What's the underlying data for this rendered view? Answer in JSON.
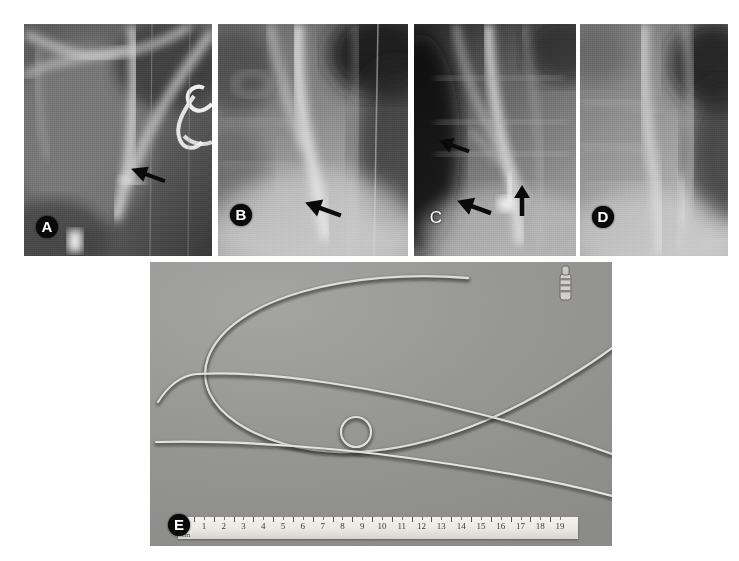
{
  "figure": {
    "caption_present": false,
    "background_color": "#ffffff",
    "width": 739,
    "height": 561,
    "panel_count": 5
  },
  "panels": [
    {
      "id": "A",
      "label": "A",
      "label_style": "circled-white-on-black",
      "type": "radiograph",
      "x": 24,
      "y": 24,
      "width": 188,
      "height": 232,
      "label_x": 12,
      "label_y": 192,
      "arrows": [
        {
          "name": "arrow-a-1",
          "x": 104,
          "y": 140,
          "angle": 200,
          "length": 30
        }
      ]
    },
    {
      "id": "B",
      "label": "B",
      "label_style": "circled-white-on-black",
      "type": "radiograph",
      "x": 218,
      "y": 24,
      "width": 190,
      "height": 232,
      "label_x": 12,
      "label_y": 180,
      "arrows": [
        {
          "name": "arrow-b-1",
          "x": 84,
          "y": 174,
          "angle": 200,
          "length": 32
        }
      ]
    },
    {
      "id": "C",
      "label": "C",
      "label_style": "plain-white",
      "type": "radiograph",
      "x": 414,
      "y": 24,
      "width": 162,
      "height": 232,
      "label_x": 14,
      "label_y": 184,
      "arrows": [
        {
          "name": "arrow-c-1",
          "x": 22,
          "y": 112,
          "angle": 200,
          "length": 28
        },
        {
          "name": "arrow-c-2",
          "x": 40,
          "y": 172,
          "angle": 200,
          "length": 30
        },
        {
          "name": "arrow-c-3",
          "x": 98,
          "y": 166,
          "angle": 270,
          "length": 26
        }
      ]
    },
    {
      "id": "D",
      "label": "D",
      "label_style": "circled-white-on-black",
      "type": "radiograph",
      "x": 580,
      "y": 24,
      "width": 148,
      "height": 232,
      "label_x": 12,
      "label_y": 182,
      "arrows": []
    },
    {
      "id": "E",
      "label": "E",
      "label_style": "circled-white-on-black",
      "type": "photograph",
      "x": 150,
      "y": 262,
      "width": 462,
      "height": 284,
      "label_x": 18,
      "label_y": 252,
      "arrows": [],
      "contents": "three catheters on gray background with centimeter ruler"
    }
  ],
  "ruler": {
    "name": "centimeter-ruler",
    "unit_label": "cm",
    "x": 178,
    "y": 517,
    "width": 400,
    "height": 22,
    "numbers": [
      "1",
      "2",
      "3",
      "4",
      "5",
      "6",
      "7",
      "8",
      "9",
      "10",
      "11",
      "12",
      "13",
      "14",
      "15",
      "16",
      "17",
      "18",
      "19"
    ],
    "min": 1,
    "max": 19
  },
  "catheters": [
    {
      "name": "looped-catheter",
      "description": "long catheter forming a large open loop with a small pigtail coil at its distal tip, connector hub at proximal end"
    },
    {
      "name": "angled-tip-catheter",
      "description": "straight catheter with an angled (cobra-shaped) distal tip"
    },
    {
      "name": "straight-catheter",
      "description": "straight catheter lying along the lower edge"
    }
  ],
  "colors": {
    "page_background": "#ffffff",
    "photo_background": "#9a9a9a",
    "label_badge_fill": "#0a0a0a",
    "label_text": "#ffffff",
    "arrow_fill": "#0a0a0a",
    "ruler_face": "#f0efeb",
    "ruler_text": "#3a3a38"
  }
}
